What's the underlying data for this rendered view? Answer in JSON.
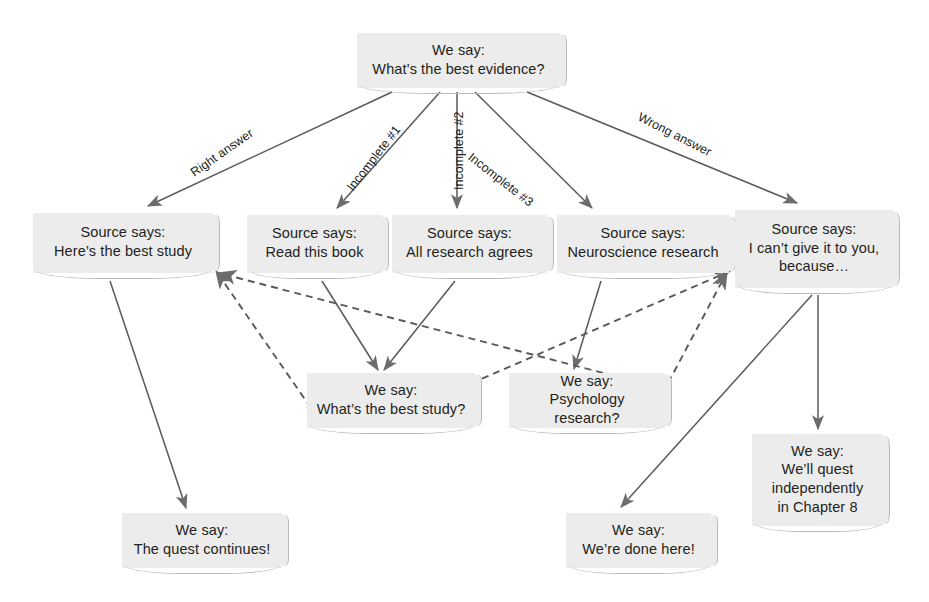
{
  "diagram": {
    "style": {
      "note_fill": "#ececec",
      "note_edge": "#b9b9b9",
      "line_color": "#58595b",
      "text_color": "#231f20"
    },
    "nodes": [
      {
        "id": "root",
        "text": "We say:\nWhat’s the best evidence?",
        "x": 357,
        "y": 33,
        "w": 203,
        "h": 55
      },
      {
        "id": "src_best",
        "text": "Source says:\nHere’s the best study",
        "x": 33,
        "y": 213,
        "w": 180,
        "h": 60
      },
      {
        "id": "src_book",
        "text": "Source says:\nRead this book",
        "x": 247,
        "y": 215,
        "w": 135,
        "h": 58
      },
      {
        "id": "src_all",
        "text": "Source says:\nAll research agrees",
        "x": 392,
        "y": 215,
        "w": 155,
        "h": 58
      },
      {
        "id": "src_neuro",
        "text": "Source says:\nNeuroscience research",
        "x": 557,
        "y": 215,
        "w": 172,
        "h": 58
      },
      {
        "id": "src_cant",
        "text": "Source says:\nI can’t give it to you,\nbecause…",
        "x": 735,
        "y": 210,
        "w": 158,
        "h": 78
      },
      {
        "id": "ws_study",
        "text": "We say:\nWhat’s the best study?",
        "x": 307,
        "y": 373,
        "w": 168,
        "h": 55
      },
      {
        "id": "ws_psych",
        "text": "We say:\nPsychology research?",
        "x": 509,
        "y": 373,
        "w": 156,
        "h": 55
      },
      {
        "id": "ws_chapter",
        "text": "We say:\nWe’ll quest\nindependently\nin Chapter 8",
        "x": 752,
        "y": 434,
        "w": 131,
        "h": 92
      },
      {
        "id": "ws_continue",
        "text": "We say:\nThe quest continues!",
        "x": 122,
        "y": 513,
        "w": 160,
        "h": 55
      },
      {
        "id": "ws_done",
        "text": "We say:\nWe’re done here!",
        "x": 566,
        "y": 513,
        "w": 145,
        "h": 55
      }
    ],
    "edge_labels": [
      {
        "id": "lbl_right",
        "text": "Right answer",
        "x": 188,
        "y": 168,
        "rotate": -35
      },
      {
        "id": "lbl_inc1",
        "text": "Incomplete #1",
        "x": 344,
        "y": 185,
        "rotate": -52
      },
      {
        "id": "lbl_inc2",
        "text": "Incomplete #2",
        "x": 452,
        "y": 190,
        "rotate": -90
      },
      {
        "id": "lbl_inc3",
        "text": "Incomplete #3",
        "x": 474,
        "y": 150,
        "rotate": 38
      },
      {
        "id": "lbl_wrong",
        "text": "Wrong answer",
        "x": 642,
        "y": 110,
        "rotate": 27
      }
    ],
    "edges": [
      {
        "id": "e_root_best",
        "from": "root",
        "to": "src_best",
        "style": "solid",
        "x1": 392,
        "y1": 92,
        "x2": 148,
        "y2": 206
      },
      {
        "id": "e_root_book",
        "from": "root",
        "to": "src_book",
        "style": "solid",
        "x1": 440,
        "y1": 92,
        "x2": 337,
        "y2": 208
      },
      {
        "id": "e_root_all",
        "from": "root",
        "to": "src_all",
        "style": "solid",
        "x1": 457,
        "y1": 92,
        "x2": 457,
        "y2": 208
      },
      {
        "id": "e_root_neuro",
        "from": "root",
        "to": "src_neuro",
        "style": "solid",
        "x1": 475,
        "y1": 92,
        "x2": 592,
        "y2": 208
      },
      {
        "id": "e_root_cant",
        "from": "root",
        "to": "src_cant",
        "style": "solid",
        "x1": 527,
        "y1": 92,
        "x2": 797,
        "y2": 203
      },
      {
        "id": "e_best_continue",
        "from": "src_best",
        "to": "ws_continue",
        "style": "solid",
        "x1": 110,
        "y1": 281,
        "x2": 186,
        "y2": 508
      },
      {
        "id": "e_book_study",
        "from": "src_book",
        "to": "ws_study",
        "style": "solid",
        "x1": 322,
        "y1": 281,
        "x2": 378,
        "y2": 370
      },
      {
        "id": "e_all_study",
        "from": "src_all",
        "to": "ws_study",
        "style": "solid",
        "x1": 455,
        "y1": 281,
        "x2": 384,
        "y2": 370
      },
      {
        "id": "e_neuro_psych",
        "from": "src_neuro",
        "to": "ws_psych",
        "style": "solid",
        "x1": 601,
        "y1": 281,
        "x2": 574,
        "y2": 369
      },
      {
        "id": "e_cant_done",
        "from": "src_cant",
        "to": "ws_done",
        "style": "solid",
        "x1": 812,
        "y1": 295,
        "x2": 621,
        "y2": 507
      },
      {
        "id": "e_cant_chapter",
        "from": "src_cant",
        "to": "ws_chapter",
        "style": "solid",
        "x1": 818,
        "y1": 295,
        "x2": 818,
        "y2": 429
      },
      {
        "id": "e_study_best",
        "from": "ws_study",
        "to": "src_best",
        "style": "dashed",
        "x1": 311,
        "y1": 408,
        "x2": 216,
        "y2": 271
      },
      {
        "id": "e_psych_best",
        "from": "ws_psych",
        "to": "src_best",
        "style": "dashed",
        "x1": 661,
        "y1": 388,
        "x2": 219,
        "y2": 273
      },
      {
        "id": "e_study_cant",
        "from": "ws_study",
        "to": "src_cant",
        "style": "dashed",
        "x1": 449,
        "y1": 393,
        "x2": 730,
        "y2": 271
      },
      {
        "id": "e_psych_cant",
        "from": "ws_psych",
        "to": "src_cant",
        "style": "dashed",
        "x1": 657,
        "y1": 404,
        "x2": 727,
        "y2": 272
      }
    ]
  }
}
